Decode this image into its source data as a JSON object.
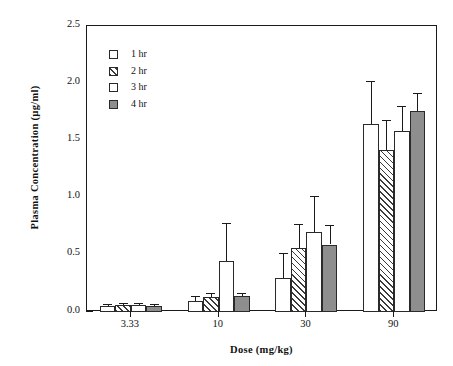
{
  "chart_data": {
    "type": "bar",
    "title": "",
    "xlabel": "Dose  (mg/kg)",
    "ylabel": "Plasma  Concentration  (µg/ml)",
    "categories": [
      "3.33",
      "10",
      "30",
      "90"
    ],
    "ylim": [
      0.0,
      2.5
    ],
    "ytick_labels": [
      "0.0",
      "0.5",
      "1.0",
      "1.5",
      "2.0",
      "2.5"
    ],
    "ytick_values": [
      0.0,
      0.5,
      1.0,
      1.5,
      2.0,
      2.5
    ],
    "yminor_values": [
      0.25,
      0.75,
      1.25,
      1.75,
      2.25
    ],
    "grid": false,
    "legend_position": "upper-left-inside",
    "series": [
      {
        "name": "1 hr",
        "fill": "open",
        "values": [
          0.05,
          0.1,
          0.3,
          1.64
        ],
        "errors": [
          0.02,
          0.04,
          0.22,
          0.38
        ]
      },
      {
        "name": "2 hr",
        "fill": "hatch",
        "values": [
          0.06,
          0.13,
          0.56,
          1.42
        ],
        "errors": [
          0.02,
          0.04,
          0.21,
          0.26
        ]
      },
      {
        "name": "3 hr",
        "fill": "open",
        "values": [
          0.06,
          0.45,
          0.7,
          1.58
        ],
        "errors": [
          0.02,
          0.33,
          0.31,
          0.22
        ]
      },
      {
        "name": "4 hr",
        "fill": "solid",
        "values": [
          0.05,
          0.14,
          0.59,
          1.76
        ],
        "errors": [
          0.02,
          0.03,
          0.17,
          0.15
        ]
      }
    ]
  },
  "legend": {
    "items": [
      {
        "label": "1 hr",
        "fill": "open"
      },
      {
        "label": "2 hr",
        "fill": "hatch"
      },
      {
        "label": "3 hr",
        "fill": "open"
      },
      {
        "label": "4 hr",
        "fill": "solid"
      }
    ]
  }
}
